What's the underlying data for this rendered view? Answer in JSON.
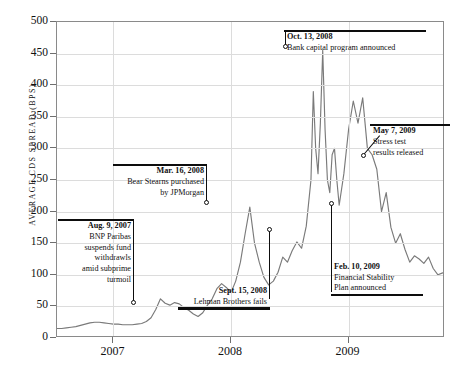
{
  "chart_data": {
    "type": "line",
    "title": "",
    "xlabel": "",
    "ylabel": "AVERAGE CDS SPREAD (BPS)",
    "ylim": [
      0,
      500
    ],
    "yticks": [
      0,
      50,
      100,
      150,
      200,
      250,
      300,
      350,
      400,
      450,
      500
    ],
    "ytick_labels": [
      "0",
      "50",
      "100",
      "150",
      "200",
      "250",
      "300",
      "350",
      "400",
      "450",
      "500"
    ],
    "xtick_labels": [
      "2007",
      "2008",
      "2009"
    ],
    "xtick_positions": [
      2007.0,
      2008.0,
      2009.0
    ],
    "xlim": [
      2006.52,
      2009.82
    ],
    "grid": true,
    "legend": "none",
    "line_color": "#7a7a7a",
    "series": [
      {
        "name": "Average CDS spread",
        "x": [
          2006.52,
          2006.56,
          2006.6,
          2006.64,
          2006.68,
          2006.72,
          2006.76,
          2006.8,
          2006.84,
          2006.88,
          2006.92,
          2006.96,
          2007.0,
          2007.04,
          2007.08,
          2007.12,
          2007.16,
          2007.2,
          2007.24,
          2007.28,
          2007.32,
          2007.36,
          2007.4,
          2007.44,
          2007.48,
          2007.52,
          2007.56,
          2007.6,
          2007.64,
          2007.68,
          2007.72,
          2007.76,
          2007.8,
          2007.84,
          2007.88,
          2007.92,
          2007.96,
          2008.0,
          2008.04,
          2008.08,
          2008.12,
          2008.16,
          2008.2,
          2008.24,
          2008.28,
          2008.32,
          2008.36,
          2008.4,
          2008.44,
          2008.48,
          2008.52,
          2008.56,
          2008.6,
          2008.64,
          2008.68,
          2008.7,
          2008.72,
          2008.74,
          2008.76,
          2008.78,
          2008.8,
          2008.82,
          2008.84,
          2008.86,
          2008.88,
          2008.9,
          2008.92,
          2008.96,
          2009.0,
          2009.04,
          2009.08,
          2009.12,
          2009.16,
          2009.2,
          2009.24,
          2009.28,
          2009.32,
          2009.36,
          2009.4,
          2009.44,
          2009.48,
          2009.52,
          2009.56,
          2009.6,
          2009.64,
          2009.68,
          2009.72,
          2009.76,
          2009.8
        ],
        "y": [
          15,
          15,
          16,
          17,
          18,
          20,
          22,
          24,
          25,
          25,
          24,
          23,
          22,
          22,
          21,
          21,
          21,
          22,
          23,
          26,
          32,
          45,
          62,
          55,
          52,
          56,
          54,
          48,
          44,
          38,
          34,
          40,
          52,
          62,
          78,
          86,
          80,
          72,
          90,
          120,
          165,
          207,
          150,
          120,
          96,
          84,
          90,
          104,
          128,
          120,
          138,
          152,
          142,
          177,
          250,
          390,
          300,
          260,
          340,
          455,
          330,
          250,
          230,
          290,
          300,
          250,
          210,
          260,
          330,
          375,
          340,
          380,
          300,
          290,
          267,
          200,
          230,
          175,
          150,
          165,
          140,
          120,
          130,
          125,
          118,
          128,
          110,
          100,
          103
        ]
      }
    ],
    "annotations": [
      {
        "id": "bnp",
        "date_label": "Aug. 9, 2007",
        "lines": [
          "BNP Paribas",
          "suspends fund",
          "withdrawls",
          "amid subprime",
          "turmoil"
        ],
        "point_value": 62,
        "align": "right"
      },
      {
        "id": "bear-stearns",
        "date_label": "Mar. 16, 2008",
        "lines": [
          "Bear Stearns purchased",
          "by JPMorgan"
        ],
        "point_value": 207,
        "align": "right"
      },
      {
        "id": "lehman",
        "date_label": "Sept. 15, 2008",
        "lines": [
          "Lehman Brothers fails"
        ],
        "point_value": 177,
        "align": "right"
      },
      {
        "id": "bank-capital",
        "date_label": "Oct. 13, 2008",
        "lines": [
          "Bank capital program announced"
        ],
        "point_value": 455,
        "align": "left"
      },
      {
        "id": "financial-stability",
        "date_label": "Feb. 10, 2009",
        "lines": [
          "Financial Stability",
          "Plan announced"
        ],
        "point_value": 210,
        "align": "left"
      },
      {
        "id": "stress-test",
        "date_label": "May 7, 2009",
        "lines": [
          "Stress test",
          "results released"
        ],
        "point_value": 267,
        "align": "left"
      }
    ]
  },
  "axis": {
    "y_title": "AVERAGE CDS SPREAD (BPS)",
    "y_labels": [
      "500",
      "450",
      "400",
      "350",
      "300",
      "250",
      "200",
      "150",
      "100",
      "50",
      "0"
    ],
    "x_labels": [
      "2007",
      "2008",
      "2009"
    ]
  },
  "annotation_text": {
    "bnp": {
      "title": "Aug. 9, 2007",
      "l1": "BNP Paribas",
      "l2": "suspends fund",
      "l3": "withdrawls",
      "l4": "amid subprime",
      "l5": "turmoil"
    },
    "bear": {
      "title": "Mar. 16, 2008",
      "l1": "Bear Stearns purchased",
      "l2": "by JPMorgan"
    },
    "lehman": {
      "title": "Sept. 15, 2008",
      "l1": "Lehman Brothers fails"
    },
    "bankcap": {
      "title": "Oct. 13, 2008",
      "l1": "Bank capital program announced"
    },
    "finstab": {
      "title": "Feb. 10, 2009",
      "l1": "Financial Stability",
      "l2": "Plan announced"
    },
    "stress": {
      "title": "May 7, 2009",
      "l1": "Stress test",
      "l2": "results released"
    }
  }
}
